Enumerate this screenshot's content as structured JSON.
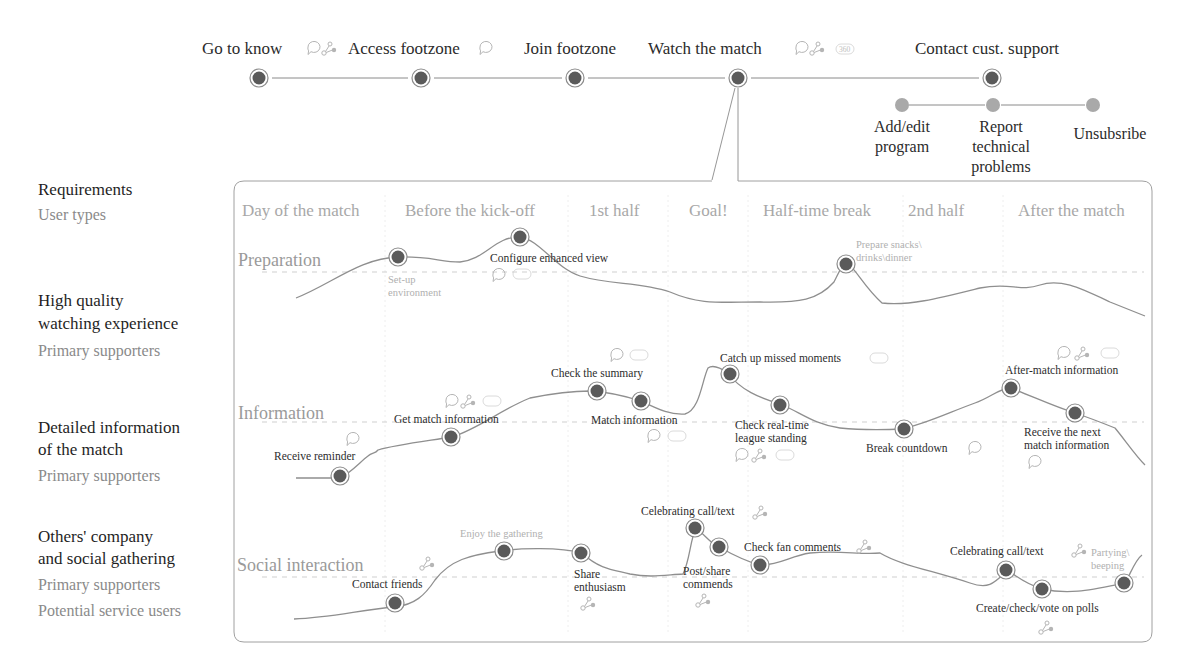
{
  "journey": {
    "stages": [
      {
        "label": "Go to know",
        "x": 259,
        "icons": [
          "chat-icon",
          "share-icon"
        ]
      },
      {
        "label": "Access footzone",
        "x": 421,
        "icons": [
          "chat-icon"
        ]
      },
      {
        "label": "Join footzone",
        "x": 575,
        "icons": []
      },
      {
        "label": "Watch the match",
        "x": 738,
        "icons": [
          "chat-icon",
          "share-icon",
          "360-badge"
        ]
      },
      {
        "label": "Contact cust. support",
        "x": 992,
        "icons": []
      }
    ],
    "substages": [
      {
        "label_lines": [
          "Add/edit",
          "program"
        ],
        "x": 902
      },
      {
        "label_lines": [
          "Report",
          "technical",
          "problems"
        ],
        "x": 993
      },
      {
        "label_lines": [
          "Unsubsribe"
        ],
        "x": 1093
      }
    ]
  },
  "requirements": {
    "header": "Requirements",
    "header_sub": "User types",
    "items": [
      {
        "title_lines": [
          "High quality",
          "watching experience"
        ],
        "users": [
          "Primary supporters"
        ]
      },
      {
        "title_lines": [
          "Detailed information",
          "of the match"
        ],
        "users": [
          "Primary supporters"
        ]
      },
      {
        "title_lines": [
          "Others' company",
          "and social gathering"
        ],
        "users": [
          "Primary supporters",
          "Potential service users"
        ]
      }
    ]
  },
  "phases": [
    "Day of the match",
    "Before the kick-off",
    "1st half",
    "Goal!",
    "Half-time break",
    "2nd half",
    "After the match"
  ],
  "lanes": [
    {
      "name": "Preparation",
      "touchpoints": [
        {
          "label": "Set-up environment",
          "faint": true
        },
        {
          "label": "Configure enhanced view",
          "faint": false,
          "icons": [
            "chat-icon",
            "360-badge"
          ]
        },
        {
          "label": "Prepare snacks\\ drinks\\dinner",
          "faint": true
        }
      ]
    },
    {
      "name": "Information",
      "touchpoints": [
        {
          "label": "Receive reminder",
          "icons": [
            "chat-icon"
          ]
        },
        {
          "label": "Get match information",
          "icons": [
            "chat-icon",
            "share-icon",
            "360-badge"
          ]
        },
        {
          "label": "Check the summary",
          "icons": [
            "chat-icon",
            "360-badge"
          ]
        },
        {
          "label": "Match information",
          "icons": [
            "chat-icon",
            "360-badge"
          ]
        },
        {
          "label": "Catch up missed moments",
          "icons": [
            "360-badge"
          ]
        },
        {
          "label": "Check real-time league standing",
          "icons": [
            "chat-icon",
            "share-icon",
            "360-badge"
          ]
        },
        {
          "label": "Break countdown",
          "icons": [
            "chat-icon"
          ]
        },
        {
          "label": "After-match information",
          "icons": [
            "chat-icon",
            "share-icon",
            "360-badge"
          ]
        },
        {
          "label": "Receive the next match information",
          "icons": [
            "chat-icon"
          ]
        }
      ]
    },
    {
      "name": "Social interaction",
      "touchpoints": [
        {
          "label": "Contact friends",
          "icons": [
            "share-icon"
          ]
        },
        {
          "label": "Enjoy the gathering",
          "faint": true
        },
        {
          "label": "Share enthusiasm",
          "icons": [
            "share-icon"
          ]
        },
        {
          "label": "Celebrating call/text",
          "icons": [
            "share-icon"
          ]
        },
        {
          "label": "Post/share commends",
          "icons": [
            "share-icon"
          ]
        },
        {
          "label": "Check fan comments",
          "icons": [
            "share-icon"
          ]
        },
        {
          "label": "Celebrating call/text",
          "icons": [
            "share-icon"
          ]
        },
        {
          "label": "Create/check/vote on polls",
          "icons": [
            "share-icon"
          ]
        },
        {
          "label": "Partying\\ beeping",
          "faint": true,
          "icons": [
            "share-icon"
          ]
        }
      ]
    }
  ],
  "badge_text": "360",
  "colors": {
    "node_fill": "#5a5a5a",
    "node_ring": "#8c8c8c",
    "sub_node": "#a9a9a9",
    "curve": "#8f8f8f",
    "frame": "#a0a0a0",
    "faint_text": "#b0b0b0"
  }
}
